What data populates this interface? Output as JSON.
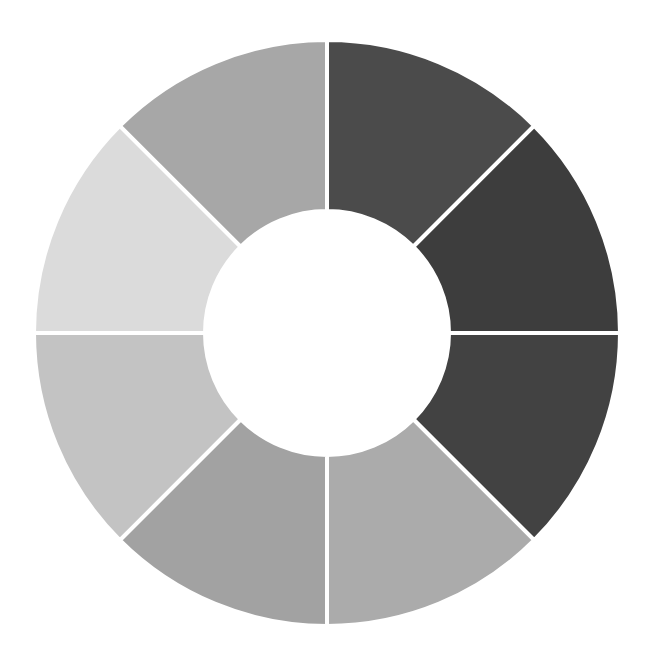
{
  "chart_data": {
    "type": "pie",
    "variant": "donut",
    "title": "",
    "categories": [
      "Segment 1",
      "Segment 2",
      "Segment 3",
      "Segment 4",
      "Segment 5",
      "Segment 6",
      "Segment 7",
      "Segment 8"
    ],
    "values": [
      12.5,
      12.5,
      12.5,
      12.5,
      12.5,
      12.5,
      12.5,
      12.5
    ],
    "colors": [
      "#4b4b4b",
      "#3d3d3d",
      "#424242",
      "#ababab",
      "#a2a2a2",
      "#c3c3c3",
      "#dbdbdb",
      "#a7a7a7"
    ],
    "start_angle_deg": 0,
    "direction": "clockwise",
    "legend": "none",
    "labels_visible": false,
    "geometry": {
      "cx": 327,
      "cy": 333,
      "outer_radius": 293,
      "inner_radius": 122,
      "separator_color": "#ffffff",
      "separator_width": 4
    }
  }
}
